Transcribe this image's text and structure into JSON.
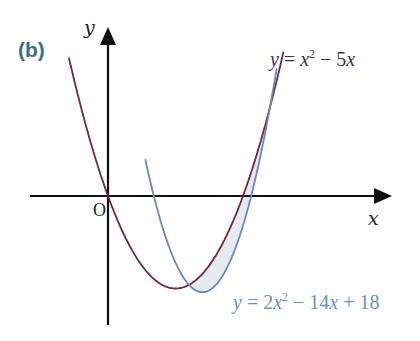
{
  "figure": {
    "part_label": "(b)",
    "axis_labels": {
      "x": "x",
      "y": "y",
      "origin": "O"
    },
    "curves": [
      {
        "name": "curve-red",
        "label_prefix": "y = ",
        "label_var": "x",
        "label_exp": "2",
        "label_rest": " − 5x",
        "equation": "y = x^2 - 5x",
        "color": "#6b2a3e"
      },
      {
        "name": "curve-blue",
        "label_prefix": "y = 2",
        "label_var": "x",
        "label_exp": "2",
        "label_rest": " − 14x + 18",
        "equation": "y = 2x^2 - 14x + 18",
        "color": "#6a86c0"
      }
    ],
    "shaded_region": {
      "between": [
        "y = x^2 - 5x",
        "y = 2x^2 - 14x + 18"
      ],
      "x_from": 3,
      "x_to": 6,
      "fill": "#e6e9ee"
    },
    "colors": {
      "axis": "#111111",
      "part_label": "#3b6f82"
    }
  }
}
